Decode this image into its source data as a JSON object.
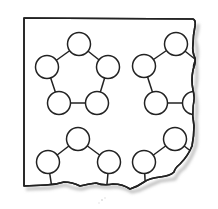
{
  "diagram": {
    "type": "lattice-fragment",
    "colors": {
      "background": "#ffffff",
      "stroke": "#222222",
      "shadow": "#c8c8c8"
    },
    "circle_radius": 11.5,
    "units": [
      {
        "name": "top-left-ring",
        "nodes": [
          [
            79,
            44
          ],
          [
            47,
            67
          ],
          [
            108,
            67
          ],
          [
            59,
            103
          ],
          [
            97,
            103
          ]
        ],
        "edges": [
          [
            0,
            1
          ],
          [
            0,
            2
          ],
          [
            1,
            3
          ],
          [
            2,
            4
          ],
          [
            3,
            4
          ]
        ]
      },
      {
        "name": "top-right-ring",
        "nodes": [
          [
            176,
            44
          ],
          [
            144,
            66
          ],
          [
            156,
            103
          ]
        ],
        "edges": [
          [
            0,
            1
          ],
          [
            1,
            2
          ]
        ]
      },
      {
        "name": "bottom-left-ring",
        "nodes": [
          [
            78,
            139
          ],
          [
            48,
            162
          ],
          [
            109,
            162
          ]
        ],
        "edges": [
          [
            0,
            1
          ],
          [
            0,
            2
          ]
        ]
      },
      {
        "name": "bottom-right-ring",
        "nodes": [
          [
            175,
            139
          ],
          [
            144,
            162
          ]
        ],
        "edges": [
          [
            0,
            1
          ]
        ]
      }
    ]
  }
}
